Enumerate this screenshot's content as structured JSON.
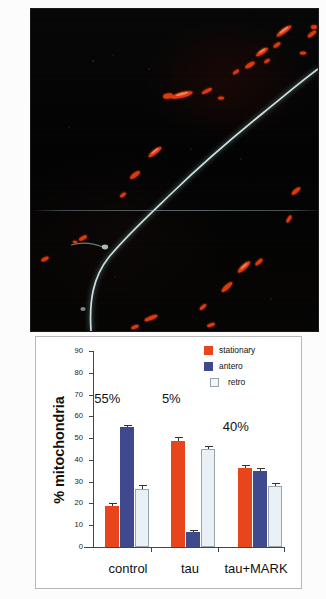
{
  "figure": {
    "panels": [
      "micrograph",
      "bar-chart"
    ]
  },
  "micrograph": {
    "description": "fluorescence micrograph of a neurite",
    "background_color": "#050505",
    "mitochondria_color": "#e03a10",
    "axon_color": "#cfe4e2"
  },
  "chart_data": {
    "type": "bar",
    "title": "",
    "xlabel": "",
    "ylabel": "% mitochondria",
    "ylim": [
      0,
      90
    ],
    "yticks": [
      0,
      10,
      20,
      30,
      40,
      50,
      60,
      70,
      80,
      90
    ],
    "ytick_labels": [
      "0",
      "10",
      "20",
      "30",
      "40",
      "50",
      "60",
      "70",
      "80",
      "90"
    ],
    "grid": false,
    "legend_position": "top-right",
    "categories": [
      "control",
      "tau",
      "tau+MARK"
    ],
    "series": [
      {
        "name": "stationary",
        "color": "#e8451c",
        "values": [
          19,
          48.5,
          36.5
        ],
        "errors": [
          1.0,
          2.0,
          1.2
        ]
      },
      {
        "name": "antero",
        "color": "#3f4a8e",
        "values": [
          55,
          7,
          35
        ],
        "errors": [
          1.2,
          1.0,
          1.2
        ]
      },
      {
        "name": "retro",
        "color": "#eaf1f6",
        "values": [
          26.5,
          45,
          28
        ],
        "errors": [
          2.0,
          1.5,
          1.5
        ]
      }
    ],
    "annotations": [
      {
        "text": "55%",
        "group": "control",
        "x_pct": 22.0,
        "y_value": 68
      },
      {
        "text": "5%",
        "group": "tau",
        "x_pct": 47.5,
        "y_value": 68
      },
      {
        "text": "40%",
        "group": "tau+MARK",
        "x_pct": 70.5,
        "y_value": 55
      }
    ],
    "legend": [
      {
        "label": "stationary",
        "color": "#e8451c"
      },
      {
        "label": "antero",
        "color": "#3f4a8e"
      },
      {
        "label": "retro",
        "color": "#eaf1f6"
      }
    ]
  }
}
